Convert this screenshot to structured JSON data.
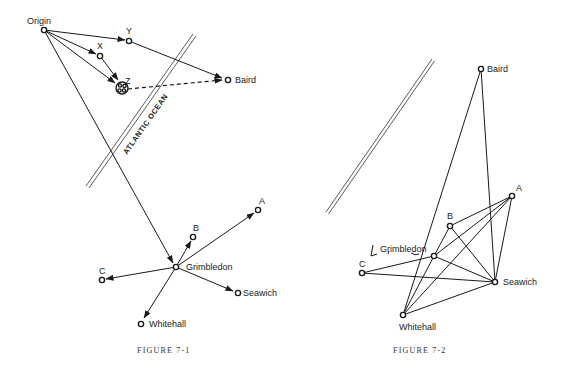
{
  "figure1": {
    "caption": "FIGURE 7-1",
    "ocean_label": "ATLANTIC OCEAN",
    "nodes": {
      "origin": {
        "label": "Origin",
        "x": 44,
        "y": 30
      },
      "y": {
        "label": "Y",
        "x": 129,
        "y": 41
      },
      "x": {
        "label": "X",
        "x": 100,
        "y": 56
      },
      "z": {
        "label": "Z",
        "x": 122,
        "y": 87
      },
      "baird": {
        "label": "Baird",
        "x": 227,
        "y": 80
      },
      "grimbledon": {
        "label": "Grimbledon",
        "x": 176,
        "y": 267
      },
      "b": {
        "label": "B",
        "x": 193,
        "y": 237
      },
      "a": {
        "label": "A",
        "x": 258,
        "y": 210
      },
      "c": {
        "label": "C",
        "x": 102,
        "y": 280
      },
      "seawich": {
        "label": "Seawich",
        "x": 237,
        "y": 293
      },
      "whitehall": {
        "label": "Whitehall",
        "x": 141,
        "y": 323
      }
    },
    "edges": [
      {
        "from": "Origin",
        "to": "Y",
        "style": "arrow"
      },
      {
        "from": "Origin",
        "to": "X",
        "style": "arrow"
      },
      {
        "from": "Origin",
        "to": "Z",
        "style": "arrow"
      },
      {
        "from": "X",
        "to": "Z",
        "style": "arrow"
      },
      {
        "from": "Y",
        "to": "Baird",
        "style": "arrow"
      },
      {
        "from": "Z",
        "to": "Baird",
        "style": "dashed-arrow"
      },
      {
        "from": "Origin",
        "to": "Grimbledon",
        "style": "arrow"
      },
      {
        "from": "Grimbledon",
        "to": "B",
        "style": "arrow"
      },
      {
        "from": "Grimbledon",
        "to": "A",
        "style": "arrow"
      },
      {
        "from": "Grimbledon",
        "to": "C",
        "style": "arrow"
      },
      {
        "from": "Grimbledon",
        "to": "Seawich",
        "style": "arrow"
      },
      {
        "from": "Grimbledon",
        "to": "Whitehall",
        "style": "arrow"
      }
    ]
  },
  "figure2": {
    "caption": "FIGURE 7-2",
    "nodes": {
      "baird": {
        "label": "Baird",
        "x": 481,
        "y": 69
      },
      "a": {
        "label": "A",
        "x": 512,
        "y": 196
      },
      "b": {
        "label": "B",
        "x": 450,
        "y": 226
      },
      "grimbledon": {
        "label": "Grimbledon",
        "x": 434,
        "y": 256
      },
      "c": {
        "label": "C",
        "x": 362,
        "y": 273
      },
      "seawich": {
        "label": "Seawich",
        "x": 495,
        "y": 282
      },
      "whitehall": {
        "label": "Whitehall",
        "x": 403,
        "y": 315
      }
    },
    "edges": [
      {
        "from": "Baird",
        "to": "Whitehall"
      },
      {
        "from": "Baird",
        "to": "Seawich"
      },
      {
        "from": "A",
        "to": "B"
      },
      {
        "from": "A",
        "to": "Grimbledon"
      },
      {
        "from": "A",
        "to": "Whitehall"
      },
      {
        "from": "A",
        "to": "Seawich"
      },
      {
        "from": "B",
        "to": "Grimbledon"
      },
      {
        "from": "B",
        "to": "Seawich"
      },
      {
        "from": "Grimbledon",
        "to": "C"
      },
      {
        "from": "Grimbledon",
        "to": "Seawich"
      },
      {
        "from": "Grimbledon",
        "to": "Whitehall"
      },
      {
        "from": "C",
        "to": "Seawich"
      },
      {
        "from": "Whitehall",
        "to": "Seawich"
      }
    ]
  }
}
